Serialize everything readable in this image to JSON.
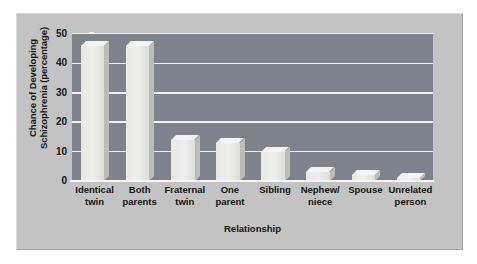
{
  "chart_data": {
    "type": "bar",
    "title": "",
    "xlabel": "Relationship",
    "ylabel": "Chance of Developing\nSchizophrenia (percentage)",
    "categories": [
      "Identical\ntwin",
      "Both\nparents",
      "Fraternal\ntwin",
      "One\nparent",
      "Sibling",
      "Nephew/\nniece",
      "Spouse",
      "Unrelated\nperson"
    ],
    "values": [
      46,
      46,
      14,
      13,
      10,
      3,
      2,
      1
    ],
    "ylim": [
      0,
      50
    ],
    "yticks": [
      0,
      10,
      20,
      30,
      40,
      50
    ],
    "ytick_labels": [
      "0",
      "10",
      "20",
      "30",
      "40",
      "50"
    ],
    "grid": true,
    "legend": "none",
    "colors": {
      "plot_background": "#7e828c",
      "panel_background": "#c3c3c3",
      "bar_face": "#eeeeec",
      "bar_top": "#f4f4f2",
      "bar_side": "#bdbdb8",
      "gridline": "#f2f2f2",
      "text": "#131313"
    }
  }
}
